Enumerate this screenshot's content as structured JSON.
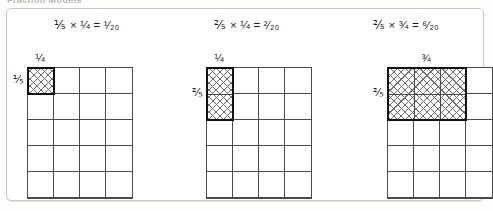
{
  "page": {
    "clipped_header_text": "Fraction Models",
    "background_color": "#fdfdfc",
    "panel_border_color": "#c9c9c6"
  },
  "colors": {
    "grid_line": "#4a4a4a",
    "shade_outline": "#111111",
    "hatch": "#6f6f6f",
    "text": "#1a1a1a"
  },
  "models": [
    {
      "equation": "⅕ × ¼ = ¹⁄₂₀",
      "top_label": "¼",
      "left_label": "⅕",
      "columns": 4,
      "rows": 5,
      "shaded_columns": 1,
      "shaded_rows": 1
    },
    {
      "equation": "⅖ × ¼ = ²⁄₂₀",
      "top_label": "¼",
      "left_label": "⅖",
      "columns": 4,
      "rows": 5,
      "shaded_columns": 1,
      "shaded_rows": 2
    },
    {
      "equation": "⅖ × ¾ = ⁶⁄₂₀",
      "top_label": "¾",
      "left_label": "⅖",
      "columns": 4,
      "rows": 5,
      "shaded_columns": 3,
      "shaded_rows": 2
    }
  ],
  "chart_data": {
    "type": "table",
    "cell_size_px": 26,
    "models": [
      {
        "equation": "1/5 × 1/4 = 1/20",
        "factor_a": "1/5",
        "factor_b": "1/4",
        "product": "1/20",
        "grid_columns": 4,
        "grid_rows": 5,
        "shaded_columns": 1,
        "shaded_rows": 1,
        "shaded_cells": 1,
        "total_cells": 20
      },
      {
        "equation": "2/5 × 1/4 = 2/20",
        "factor_a": "2/5",
        "factor_b": "1/4",
        "product": "2/20",
        "grid_columns": 4,
        "grid_rows": 5,
        "shaded_columns": 1,
        "shaded_rows": 2,
        "shaded_cells": 2,
        "total_cells": 20
      },
      {
        "equation": "2/5 × 3/4 = 6/20",
        "factor_a": "2/5",
        "factor_b": "3/4",
        "product": "6/20",
        "grid_columns": 4,
        "grid_rows": 5,
        "shaded_columns": 3,
        "shaded_rows": 2,
        "shaded_cells": 6,
        "total_cells": 20
      }
    ]
  }
}
